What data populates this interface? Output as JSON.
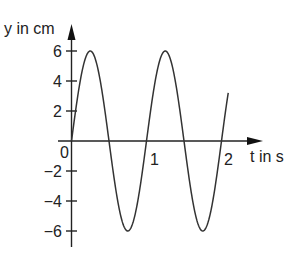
{
  "chart_data": {
    "type": "line",
    "title": "",
    "xlabel": "t in s",
    "ylabel": "y in cm",
    "x_ticks": [
      "0",
      "1",
      "2"
    ],
    "y_ticks": [
      "6",
      "4",
      "2",
      "−2",
      "−4",
      "−6"
    ],
    "origin_label": "0",
    "xlim": [
      0,
      2.5
    ],
    "ylim": [
      -7,
      7
    ],
    "grid": false,
    "legend": null,
    "series": [
      {
        "name": "y(t) = 6·sin(2π·t)",
        "amplitude": 6,
        "period": 1,
        "x": [
          0,
          0.25,
          0.5,
          0.75,
          1.0,
          1.25,
          1.5,
          1.75,
          2.0,
          2.09
        ],
        "values": [
          0,
          6,
          0,
          -6,
          0,
          6,
          0,
          -6,
          0,
          3.3
        ]
      }
    ]
  }
}
